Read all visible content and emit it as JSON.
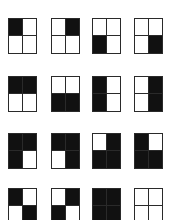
{
  "figure": {
    "fill_color": "#111111",
    "empty_color": "#ffffff",
    "line_color": "#2a2a2a",
    "layout": {
      "columns_x": [
        8,
        51,
        92,
        134
      ],
      "rows_y": [
        18,
        76,
        133,
        188
      ],
      "cell_width": 29,
      "cell_height": 36
    },
    "rows": [
      {
        "label": "single-quadrant",
        "patterns": [
          {
            "name": "top-left",
            "tl": 1,
            "tr": 0,
            "bl": 0,
            "br": 0
          },
          {
            "name": "top-right",
            "tl": 0,
            "tr": 1,
            "bl": 0,
            "br": 0
          },
          {
            "name": "bottom-left",
            "tl": 0,
            "tr": 0,
            "bl": 1,
            "br": 0
          },
          {
            "name": "bottom-right",
            "tl": 0,
            "tr": 0,
            "bl": 0,
            "br": 1
          }
        ]
      },
      {
        "label": "half-filled",
        "patterns": [
          {
            "name": "top-half",
            "tl": 1,
            "tr": 1,
            "bl": 0,
            "br": 0
          },
          {
            "name": "bottom-half",
            "tl": 0,
            "tr": 0,
            "bl": 1,
            "br": 1
          },
          {
            "name": "left-half",
            "tl": 1,
            "tr": 0,
            "bl": 1,
            "br": 0
          },
          {
            "name": "right-half",
            "tl": 0,
            "tr": 1,
            "bl": 0,
            "br": 1
          }
        ]
      },
      {
        "label": "three-quadrant",
        "patterns": [
          {
            "name": "all-but-bottom-right",
            "tl": 1,
            "tr": 1,
            "bl": 1,
            "br": 0
          },
          {
            "name": "all-but-bottom-left",
            "tl": 1,
            "tr": 1,
            "bl": 0,
            "br": 1
          },
          {
            "name": "all-but-top-left",
            "tl": 0,
            "tr": 1,
            "bl": 1,
            "br": 1
          },
          {
            "name": "all-but-top-right",
            "tl": 1,
            "tr": 0,
            "bl": 1,
            "br": 1
          }
        ]
      },
      {
        "label": "diagonal-and-extremes",
        "patterns": [
          {
            "name": "main-diagonal",
            "tl": 1,
            "tr": 0,
            "bl": 0,
            "br": 1
          },
          {
            "name": "anti-diagonal",
            "tl": 0,
            "tr": 1,
            "bl": 1,
            "br": 0
          },
          {
            "name": "all-filled",
            "tl": 1,
            "tr": 1,
            "bl": 1,
            "br": 1
          },
          {
            "name": "none-filled",
            "tl": 0,
            "tr": 0,
            "bl": 0,
            "br": 0
          }
        ]
      }
    ]
  }
}
